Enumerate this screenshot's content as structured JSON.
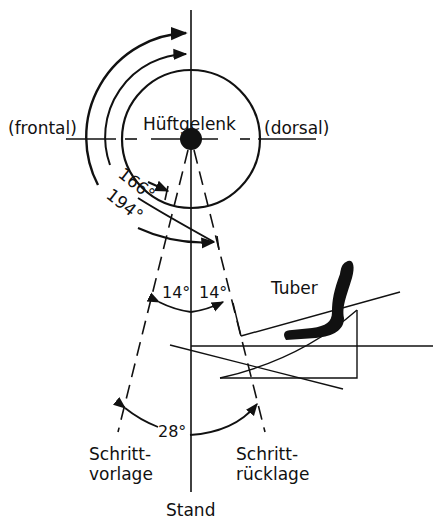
{
  "diagram": {
    "type": "technical-drawing",
    "colors": {
      "ink": "#111111",
      "background": "#ffffff"
    },
    "labels": {
      "center": "Hüftgelenk",
      "front": "(frontal)",
      "back": "(dorsal)",
      "tuber": "Tuber",
      "left_bottom_line1": "Schritt-",
      "left_bottom_line2": "vorlage",
      "right_bottom_line1": "Schritt-",
      "right_bottom_line2": "rücklage",
      "bottom": "Stand"
    },
    "angles": {
      "inner_arc": "166°",
      "outer_arc": "194°",
      "left_half": "14°",
      "right_half": "14°",
      "total": "28°"
    }
  }
}
